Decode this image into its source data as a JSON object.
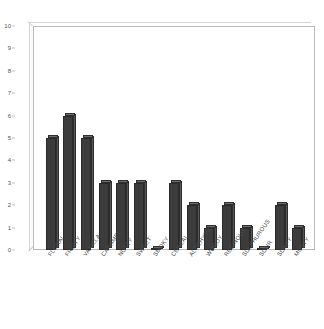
{
  "chart_data": {
    "type": "bar",
    "title": "",
    "subtitle": "",
    "xlabel": "",
    "ylabel": "",
    "ylim": [
      0,
      10
    ],
    "ytick_step": 1,
    "yticks": [
      "10",
      "9",
      "8",
      "7",
      "6",
      "5",
      "4",
      "3",
      "2",
      "1",
      "0"
    ],
    "grid": false,
    "legend": null,
    "bar_color": "#3c3c3c",
    "bar_top_color": "#6e6e6e",
    "frame_color": "#b9b9b9",
    "categories": [
      "FLORAL",
      "FRUITY",
      "VANILLA",
      "CARAMEL",
      "NUTTY",
      "SWEET",
      "SMOKY",
      "CEREAL",
      "ALDEHYDIC",
      "WOODY",
      "RESINOUS",
      "SULPHUROUS",
      "SOUR",
      "SOAPY",
      "MUSTY"
    ],
    "values": [
      5,
      6,
      5,
      3,
      3,
      3,
      0,
      3,
      2,
      1,
      2,
      1,
      0,
      2,
      1
    ]
  }
}
